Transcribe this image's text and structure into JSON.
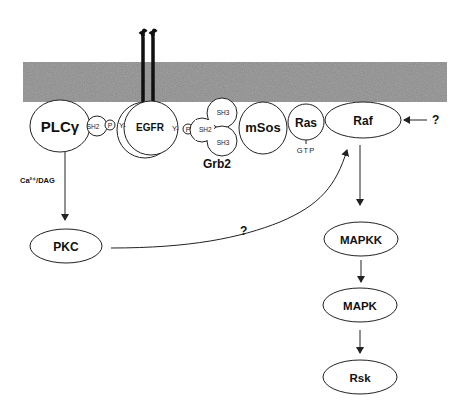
{
  "diagram": {
    "membrane_color": "#8a8a8a",
    "nodes": {
      "plcg": {
        "label": "PLCγ"
      },
      "sh2_plc": {
        "label": "SH2"
      },
      "p_left": {
        "label": "P"
      },
      "y_left": {
        "label": "Y-"
      },
      "egfr": {
        "label": "EGFR"
      },
      "y_right": {
        "label": "Y-"
      },
      "p_right": {
        "label": "P"
      },
      "sh2_grb": {
        "label": "SH2"
      },
      "sh3_top": {
        "label": "SH3"
      },
      "sh3_bottom": {
        "label": "SH3"
      },
      "grb2": {
        "label": "Grb2"
      },
      "msos": {
        "label": "mSos"
      },
      "ras": {
        "label": "Ras"
      },
      "gtp": {
        "label": "GTP"
      },
      "raf": {
        "label": "Raf"
      },
      "pkc": {
        "label": "PKC"
      },
      "mapkk": {
        "label": "MAPKK"
      },
      "mapk": {
        "label": "MAPK"
      },
      "rsk": {
        "label": "Rsk"
      }
    },
    "edges": {
      "plc_to_pkc": {
        "label": "Ca²⁺/DAG"
      },
      "pkc_to_raf": {
        "label": "?"
      },
      "unknown_to_raf": {
        "label": "?"
      }
    }
  }
}
